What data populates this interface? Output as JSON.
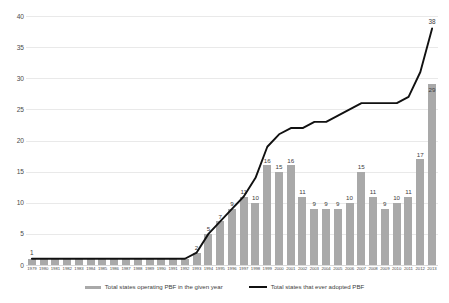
{
  "chart_data": {
    "type": "bar",
    "title": "",
    "subtitle": "",
    "xlabel": "",
    "ylabel": "",
    "ylim": [
      0,
      40
    ],
    "yticks": [
      0,
      5,
      10,
      15,
      20,
      25,
      30,
      35,
      40
    ],
    "grid": true,
    "legend_position": "bottom",
    "categories": [
      "1979",
      "1980",
      "1981",
      "1982",
      "1983",
      "1984",
      "1985",
      "1986",
      "1987",
      "1988",
      "1989",
      "1990",
      "1991",
      "1992",
      "1993",
      "1994",
      "1995",
      "1996",
      "1997",
      "1998",
      "1999",
      "2000",
      "2001",
      "2002",
      "2003",
      "2004",
      "2005",
      "2006",
      "2007",
      "2008",
      "2009",
      "2010",
      "2011",
      "2012",
      "2013"
    ],
    "series": [
      {
        "name": "Total states operating PBF in the given year",
        "type": "bar",
        "color": "#a9a9a9",
        "values": [
          1,
          1,
          1,
          1,
          1,
          1,
          1,
          1,
          1,
          1,
          1,
          1,
          1,
          1,
          2,
          5,
          7,
          9,
          11,
          10,
          16,
          15,
          16,
          11,
          9,
          9,
          9,
          10,
          15,
          11,
          9,
          10,
          11,
          17,
          29
        ],
        "labels": [
          "",
          "",
          "",
          "",
          "",
          "",
          "",
          "",
          "",
          "",
          "",
          "",
          "",
          "",
          "2",
          "5",
          "7",
          "9",
          "11",
          "10",
          "16",
          "15",
          "16",
          "11",
          "9",
          "9",
          "9",
          "10",
          "15",
          "11",
          "9",
          "10",
          "11",
          "17",
          "29"
        ]
      },
      {
        "name": "Total states that ever adopted PBF",
        "type": "line",
        "color": "#111111",
        "values": [
          1,
          1,
          1,
          1,
          1,
          1,
          1,
          1,
          1,
          1,
          1,
          1,
          1,
          1,
          2,
          5,
          7,
          9,
          11,
          14,
          19,
          21,
          22,
          22,
          23,
          23,
          24,
          25,
          26,
          26,
          26,
          26,
          27,
          31,
          38
        ],
        "labels": {
          "1979": "1",
          "2013": "38"
        }
      }
    ],
    "annotations": [
      {
        "label": "1",
        "x": "1979",
        "y": 1
      },
      {
        "label": "38",
        "x": "2013",
        "y": 38
      }
    ]
  },
  "legend": {
    "items": [
      {
        "label": "Total states operating PBF in the given year",
        "marker": "bar-swatch"
      },
      {
        "label": "Total states that ever adopted PBF",
        "marker": "line-swatch"
      }
    ]
  }
}
